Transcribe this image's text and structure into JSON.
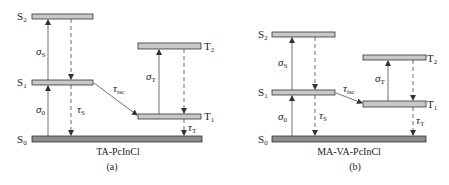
{
  "colors": {
    "excited_level_fill": "#c8c8c8",
    "ground_level_fill": "#8c8c8c",
    "stroke": "#333333",
    "background": "#ffffff"
  },
  "panels": [
    {
      "id": "a",
      "caption": "(a)",
      "molecule": "TA-PcInCl",
      "levels": {
        "S2": {
          "label": "S",
          "sub": "2"
        },
        "S1": {
          "label": "S",
          "sub": "1"
        },
        "S0": {
          "label": "S",
          "sub": "0"
        },
        "T2": {
          "label": "T",
          "sub": "2"
        },
        "T1": {
          "label": "T",
          "sub": "1"
        }
      },
      "transitions": {
        "sigma_0": {
          "sym": "σ",
          "sub": "0",
          "from": "S0",
          "to": "S1",
          "type": "absorption"
        },
        "sigma_S": {
          "sym": "σ",
          "sub": "S",
          "from": "S1",
          "to": "S2",
          "type": "absorption"
        },
        "tau_S": {
          "sym": "τ",
          "sub": "S",
          "from": "S1",
          "to": "S0",
          "type": "relaxation"
        },
        "tau_isc": {
          "sym": "τ",
          "sub": "isc",
          "from": "S1",
          "to": "T1",
          "type": "intersystem-crossing"
        },
        "sigma_T": {
          "sym": "σ",
          "sub": "T",
          "from": "T1",
          "to": "T2",
          "type": "absorption"
        },
        "tau_T": {
          "sym": "τ",
          "sub": "T",
          "from": "T1",
          "to": "S0",
          "type": "relaxation"
        }
      }
    },
    {
      "id": "b",
      "caption": "(b)",
      "molecule": "MA-VA-PcInCl",
      "levels": {
        "S2": {
          "label": "S",
          "sub": "2"
        },
        "S1": {
          "label": "S",
          "sub": "1"
        },
        "S0": {
          "label": "S",
          "sub": "0"
        },
        "T2": {
          "label": "T",
          "sub": "2"
        },
        "T1": {
          "label": "T",
          "sub": "1"
        }
      },
      "transitions": {
        "sigma_0": {
          "sym": "σ",
          "sub": "0",
          "from": "S0",
          "to": "S1",
          "type": "absorption"
        },
        "sigma_S": {
          "sym": "σ",
          "sub": "S",
          "from": "S1",
          "to": "S2",
          "type": "absorption"
        },
        "tau_S": {
          "sym": "τ",
          "sub": "S",
          "from": "S1",
          "to": "S0",
          "type": "relaxation"
        },
        "tau_isc": {
          "sym": "τ",
          "sub": "isc",
          "from": "S1",
          "to": "T1",
          "type": "intersystem-crossing"
        },
        "sigma_T": {
          "sym": "σ",
          "sub": "T",
          "from": "T1",
          "to": "T2",
          "type": "absorption"
        },
        "tau_T": {
          "sym": "τ",
          "sub": "T",
          "from": "T1",
          "to": "S0",
          "type": "relaxation"
        }
      }
    }
  ]
}
